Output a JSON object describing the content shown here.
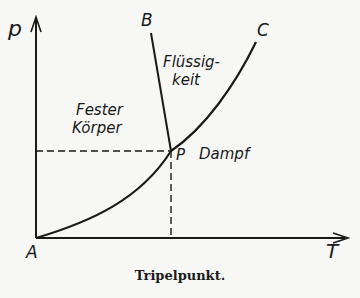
{
  "diagram": {
    "type": "phase-diagram",
    "caption": "Tripelpunkt.",
    "axes": {
      "y_label": "p",
      "x_label": "T"
    },
    "points": {
      "origin": "A",
      "triple_point": "P",
      "melt_curve_end": "B",
      "vapor_curve_end": "C"
    },
    "regions": {
      "solid_line1": "Fester",
      "solid_line2": "Körper",
      "liquid_line1": "Flüssig-",
      "liquid_line2": "keit",
      "vapor": "Dampf"
    },
    "colors": {
      "ink": "#1a1a1a",
      "background": "#f7f7f5"
    }
  }
}
